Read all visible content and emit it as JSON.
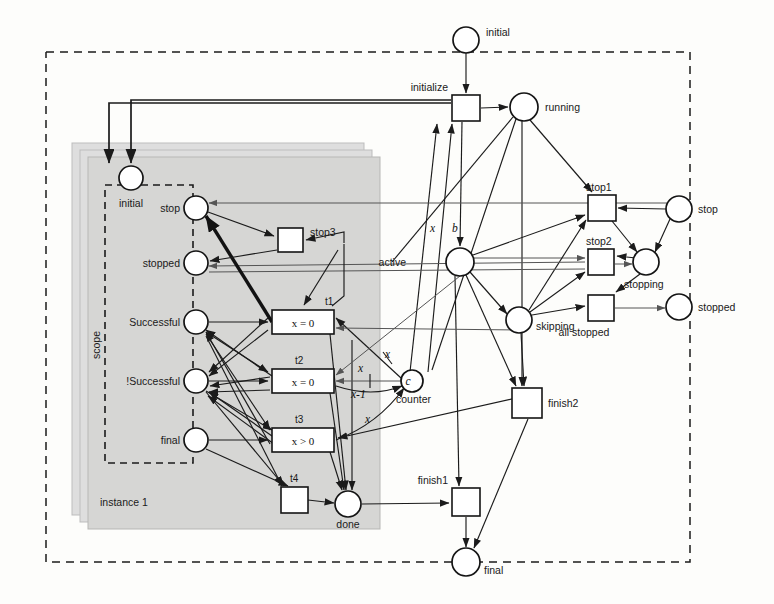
{
  "diagram": {
    "type": "petri-net",
    "outer_boundary_label": "",
    "instance_stack_label": "instance 1",
    "scope_label": "scope"
  },
  "places": [
    {
      "id": "initial_top",
      "label": "initial",
      "cx": 466,
      "cy": 40,
      "r": 13,
      "token": ""
    },
    {
      "id": "running",
      "label": "running",
      "cx": 524,
      "cy": 107,
      "r": 14,
      "token": ""
    },
    {
      "id": "active",
      "label": "active",
      "cx": 460,
      "cy": 262,
      "r": 14,
      "token": ""
    },
    {
      "id": "skipping",
      "label": "skipping",
      "cx": 519,
      "cy": 320,
      "r": 13,
      "token": ""
    },
    {
      "id": "counter",
      "label": "counter",
      "cx": 412,
      "cy": 381,
      "r": 11,
      "token": "c"
    },
    {
      "id": "final_bottom",
      "label": "final",
      "cx": 466,
      "cy": 562,
      "r": 14,
      "token": ""
    },
    {
      "id": "stop_right",
      "label": "stop",
      "cx": 679,
      "cy": 209,
      "r": 13,
      "token": ""
    },
    {
      "id": "stopping",
      "label": "stopping",
      "cx": 646,
      "cy": 262,
      "r": 13,
      "token": ""
    },
    {
      "id": "stopped_right",
      "label": "stopped",
      "cx": 679,
      "cy": 307,
      "r": 13,
      "token": ""
    },
    {
      "id": "inst_initial",
      "label": "initial",
      "cx": 131,
      "cy": 178,
      "r": 12,
      "token": ""
    },
    {
      "id": "inst_stop",
      "label": "stop",
      "cx": 196,
      "cy": 208,
      "r": 12,
      "token": ""
    },
    {
      "id": "inst_stopped",
      "label": "stopped",
      "cx": 196,
      "cy": 263,
      "r": 12,
      "token": ""
    },
    {
      "id": "inst_success",
      "label": "Successful",
      "cx": 196,
      "cy": 322,
      "r": 12,
      "token": ""
    },
    {
      "id": "inst_nsuccess",
      "label": "!Successful",
      "cx": 196,
      "cy": 381,
      "r": 12,
      "token": ""
    },
    {
      "id": "inst_final",
      "label": "final",
      "cx": 196,
      "cy": 440,
      "r": 12,
      "token": ""
    },
    {
      "id": "done",
      "label": "done",
      "cx": 348,
      "cy": 504,
      "r": 13,
      "token": ""
    }
  ],
  "transitions": [
    {
      "id": "initialize",
      "label": "initialize",
      "x": 452,
      "y": 95,
      "w": 28,
      "h": 26,
      "guard": ""
    },
    {
      "id": "stop1",
      "label": "stop1",
      "x": 588,
      "y": 195,
      "w": 28,
      "h": 26,
      "guard": ""
    },
    {
      "id": "stop2",
      "label": "stop2",
      "x": 588,
      "y": 249,
      "w": 26,
      "h": 26,
      "guard": ""
    },
    {
      "id": "all_stopped",
      "label": "all stopped",
      "x": 588,
      "y": 295,
      "w": 26,
      "h": 26,
      "guard": ""
    },
    {
      "id": "finish2",
      "label": "finish2",
      "x": 512,
      "y": 388,
      "w": 30,
      "h": 30,
      "guard": ""
    },
    {
      "id": "finish1",
      "label": "finish1",
      "x": 452,
      "y": 488,
      "w": 28,
      "h": 28,
      "guard": ""
    },
    {
      "id": "stop3",
      "label": "stop3",
      "x": 278,
      "y": 228,
      "w": 25,
      "h": 24,
      "guard": ""
    },
    {
      "id": "t1",
      "label": "t1",
      "x": 272,
      "y": 310,
      "w": 62,
      "h": 24,
      "guard": "x = 0"
    },
    {
      "id": "t2",
      "label": "t2",
      "x": 272,
      "y": 369,
      "w": 62,
      "h": 24,
      "guard": "x = 0"
    },
    {
      "id": "t3",
      "label": "t3",
      "x": 272,
      "y": 428,
      "w": 62,
      "h": 24,
      "guard": "x > 0"
    },
    {
      "id": "t4",
      "label": "t4",
      "x": 281,
      "y": 487,
      "w": 27,
      "h": 26,
      "guard": ""
    }
  ],
  "arc_inscriptions": [
    {
      "id": "insc_x_init",
      "text": "x",
      "x": 430,
      "y": 232
    },
    {
      "id": "insc_b_init",
      "text": "b",
      "x": 452,
      "y": 232
    },
    {
      "id": "insc_x_top",
      "text": "x",
      "x": 385,
      "y": 358
    },
    {
      "id": "insc_x_mid",
      "text": "x",
      "x": 358,
      "y": 372
    },
    {
      "id": "insc_x_minus_1",
      "text": "x-1",
      "x": 357,
      "y": 398
    },
    {
      "id": "insc_x_bottom",
      "text": "x",
      "x": 365,
      "y": 423
    }
  ],
  "colors": {
    "stroke": "#1b1b1b",
    "place_fill": "#ffffff",
    "transition_fill": "#ffffff",
    "instance_shade": "#d6d6d4",
    "page_background": "#fdfdfb"
  }
}
